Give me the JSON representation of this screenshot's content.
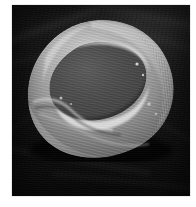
{
  "image": {
    "kind": "scanning-electron-micrograph",
    "subject": "red blood cell (erythrocyte)",
    "alt_text": "Grayscale scanning electron micrograph of a single biconcave red blood cell resting on a dark textured substrate",
    "caption": "",
    "palette": {
      "page_background": "#ffffff",
      "substrate_dark": "#0d0d0d",
      "substrate_mid": "#2e2e2e",
      "cell_rim_highlight": "#d6d6d6",
      "cell_surface_light": "#b4b4b4",
      "cell_surface_mid": "#8f8f8f",
      "cell_concavity": "#4a4a4a",
      "cell_shadow": "#2a2a2a"
    },
    "plate": {
      "left": 12,
      "top": 5,
      "width": 178,
      "height": 191
    },
    "cell": {
      "left": 13,
      "top": 13,
      "width": 152,
      "height": 144,
      "features": [
        "raised torus rim",
        "central biconcave depression",
        "granular membrane texture",
        "lower-left surface fold"
      ]
    }
  }
}
